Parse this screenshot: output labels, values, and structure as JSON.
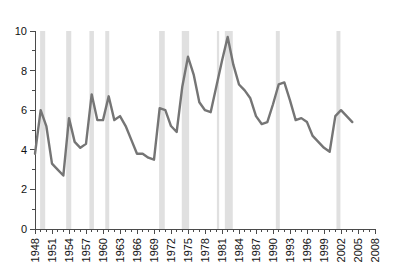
{
  "chart_data": {
    "type": "line",
    "title": "",
    "xlabel": "",
    "ylabel": "",
    "xlim": [
      1948,
      2008
    ],
    "ylim": [
      0,
      10
    ],
    "grid": false,
    "legend": null,
    "line_color": "#757575",
    "band_color": "#e0e0e0",
    "axis_color": "#4a4a4a",
    "y_ticks": [
      0,
      2,
      4,
      6,
      8,
      10
    ],
    "y_tick_labels": [
      "0",
      "2",
      "4",
      "6",
      "8",
      "10"
    ],
    "y_minor_step": 1,
    "x_tick_labels": [
      "1948",
      "1951",
      "1954",
      "1957",
      "1960",
      "1963",
      "1966",
      "1969",
      "1972",
      "1975",
      "1978",
      "1981",
      "1984",
      "1987",
      "1990",
      "1993",
      "1996",
      "1999",
      "2002",
      "2005",
      "2008"
    ],
    "x_tick_step": 3,
    "x_minor_step": 1,
    "x": [
      1948,
      1949,
      1950,
      1951,
      1952,
      1953,
      1954,
      1955,
      1956,
      1957,
      1958,
      1959,
      1960,
      1961,
      1962,
      1963,
      1964,
      1965,
      1966,
      1967,
      1968,
      1969,
      1970,
      1971,
      1972,
      1973,
      1974,
      1975,
      1976,
      1977,
      1978,
      1979,
      1980,
      1981,
      1982,
      1983,
      1984,
      1985,
      1986,
      1987,
      1988,
      1989,
      1990,
      1991,
      1992,
      1993,
      1994,
      1995,
      1996,
      1997,
      1998,
      1999,
      2000,
      2001,
      2002,
      2003,
      2004
    ],
    "values": [
      3.8,
      6.0,
      5.2,
      3.3,
      3.0,
      2.7,
      5.6,
      4.4,
      4.1,
      4.3,
      6.8,
      5.5,
      5.5,
      6.7,
      5.5,
      5.7,
      5.2,
      4.5,
      3.8,
      3.8,
      3.6,
      3.5,
      6.1,
      6.0,
      5.2,
      4.9,
      7.2,
      8.7,
      7.8,
      6.4,
      6.0,
      5.9,
      7.2,
      8.5,
      9.7,
      8.3,
      7.3,
      7.0,
      6.6,
      5.7,
      5.3,
      5.4,
      6.3,
      7.3,
      7.4,
      6.5,
      5.5,
      5.6,
      5.4,
      4.7,
      4.4,
      4.1,
      3.9,
      5.7,
      6.0,
      5.7,
      5.4
    ],
    "recession_bands": [
      {
        "start": 1948.9,
        "end": 1949.8
      },
      {
        "start": 1953.5,
        "end": 1954.4
      },
      {
        "start": 1957.6,
        "end": 1958.4
      },
      {
        "start": 1960.4,
        "end": 1961.1
      },
      {
        "start": 1969.9,
        "end": 1970.9
      },
      {
        "start": 1973.9,
        "end": 1975.2
      },
      {
        "start": 1980.1,
        "end": 1980.5
      },
      {
        "start": 1981.5,
        "end": 1982.9
      },
      {
        "start": 1990.5,
        "end": 1991.2
      },
      {
        "start": 2001.2,
        "end": 2001.9
      }
    ]
  }
}
